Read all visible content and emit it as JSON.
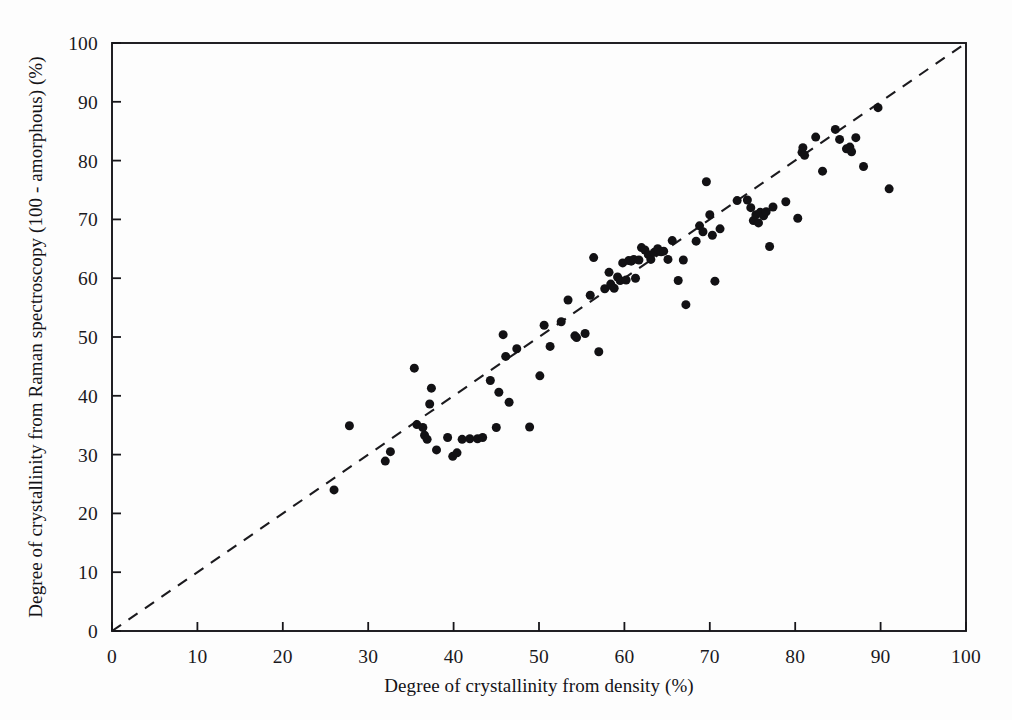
{
  "chart_data": {
    "type": "scatter",
    "title": "",
    "xlabel": "Degree of crystallinity from density (%)",
    "ylabel": "Degree of crystallinity from Raman spectroscopy (100 - amorphous) (%)",
    "xlim": [
      0,
      100
    ],
    "ylim": [
      0,
      100
    ],
    "xticks": [
      0,
      10,
      20,
      30,
      40,
      50,
      60,
      70,
      80,
      90,
      100
    ],
    "yticks": [
      0,
      10,
      20,
      30,
      40,
      50,
      60,
      70,
      80,
      90,
      100
    ],
    "grid": false,
    "legend": null,
    "marker": "filled-circle",
    "marker_color": "#121114",
    "marker_size_px": 9,
    "reference_line": {
      "kind": "identity",
      "label": "y = x (1:1 line)",
      "style": "dashed",
      "color": "#1b1a1e",
      "from": [
        0,
        0
      ],
      "to": [
        100,
        100
      ]
    },
    "points": [
      [
        26.0,
        24.0
      ],
      [
        27.8,
        34.9
      ],
      [
        32.0,
        28.9
      ],
      [
        32.6,
        30.5
      ],
      [
        35.4,
        44.7
      ],
      [
        35.7,
        35.1
      ],
      [
        36.4,
        34.6
      ],
      [
        36.6,
        33.3
      ],
      [
        36.9,
        32.6
      ],
      [
        37.2,
        38.6
      ],
      [
        37.4,
        41.3
      ],
      [
        38.0,
        30.8
      ],
      [
        39.3,
        32.9
      ],
      [
        39.9,
        29.7
      ],
      [
        40.4,
        30.3
      ],
      [
        41.0,
        32.6
      ],
      [
        41.9,
        32.7
      ],
      [
        42.8,
        32.7
      ],
      [
        43.4,
        32.9
      ],
      [
        44.3,
        42.6
      ],
      [
        45.0,
        34.6
      ],
      [
        45.3,
        40.6
      ],
      [
        45.8,
        50.4
      ],
      [
        46.1,
        46.7
      ],
      [
        46.5,
        38.9
      ],
      [
        47.4,
        48.0
      ],
      [
        48.9,
        34.7
      ],
      [
        50.1,
        43.4
      ],
      [
        50.6,
        52.0
      ],
      [
        51.3,
        48.4
      ],
      [
        52.6,
        52.6
      ],
      [
        53.4,
        56.3
      ],
      [
        54.2,
        50.2
      ],
      [
        54.4,
        49.9
      ],
      [
        55.4,
        50.6
      ],
      [
        56.0,
        57.1
      ],
      [
        56.4,
        63.5
      ],
      [
        57.0,
        47.5
      ],
      [
        57.7,
        58.2
      ],
      [
        58.2,
        61.0
      ],
      [
        58.4,
        59.0
      ],
      [
        58.8,
        58.3
      ],
      [
        59.2,
        60.2
      ],
      [
        59.5,
        59.6
      ],
      [
        59.8,
        62.6
      ],
      [
        60.2,
        59.7
      ],
      [
        60.5,
        63.0
      ],
      [
        60.8,
        62.9
      ],
      [
        61.1,
        63.2
      ],
      [
        61.3,
        60.0
      ],
      [
        61.7,
        63.1
      ],
      [
        62.0,
        65.2
      ],
      [
        62.4,
        64.8
      ],
      [
        62.8,
        64.0
      ],
      [
        63.1,
        63.2
      ],
      [
        63.5,
        64.4
      ],
      [
        63.9,
        65.0
      ],
      [
        64.3,
        64.5
      ],
      [
        64.6,
        64.6
      ],
      [
        65.1,
        63.2
      ],
      [
        65.6,
        66.4
      ],
      [
        66.3,
        59.6
      ],
      [
        66.9,
        63.1
      ],
      [
        67.2,
        55.5
      ],
      [
        68.4,
        66.3
      ],
      [
        68.8,
        68.9
      ],
      [
        69.2,
        67.9
      ],
      [
        69.6,
        76.4
      ],
      [
        70.0,
        70.8
      ],
      [
        70.3,
        67.3
      ],
      [
        70.6,
        59.5
      ],
      [
        71.2,
        68.4
      ],
      [
        73.2,
        73.2
      ],
      [
        74.4,
        73.3
      ],
      [
        74.8,
        72.0
      ],
      [
        75.1,
        69.8
      ],
      [
        75.4,
        70.8
      ],
      [
        75.7,
        69.4
      ],
      [
        75.9,
        71.2
      ],
      [
        76.3,
        70.6
      ],
      [
        76.6,
        71.3
      ],
      [
        77.0,
        65.4
      ],
      [
        77.4,
        72.1
      ],
      [
        78.9,
        73.0
      ],
      [
        80.3,
        70.2
      ],
      [
        80.8,
        81.4
      ],
      [
        80.9,
        82.2
      ],
      [
        81.1,
        80.9
      ],
      [
        82.4,
        84.0
      ],
      [
        83.2,
        78.2
      ],
      [
        84.7,
        85.3
      ],
      [
        85.2,
        83.6
      ],
      [
        86.0,
        82.0
      ],
      [
        86.4,
        82.3
      ],
      [
        86.6,
        81.5
      ],
      [
        87.1,
        83.9
      ],
      [
        88.0,
        79.0
      ],
      [
        89.7,
        89.0
      ],
      [
        91.0,
        75.2
      ]
    ]
  }
}
